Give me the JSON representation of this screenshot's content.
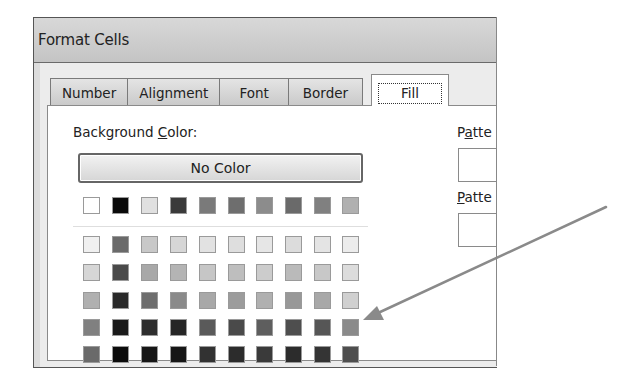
{
  "window": {
    "title": "Format Cells"
  },
  "tabs": [
    {
      "label": "Number",
      "active": false
    },
    {
      "label": "Alignment",
      "active": false
    },
    {
      "label": "Font",
      "active": false
    },
    {
      "label": "Border",
      "active": false
    },
    {
      "label": "Fill",
      "active": true
    }
  ],
  "fill": {
    "background_color_label_pre": "Background ",
    "background_color_label_accel": "C",
    "background_color_label_post": "olor:",
    "no_color_button": "No Color",
    "pattern_color_label_pre": "P",
    "pattern_color_label_accel": "a",
    "pattern_color_label_post": "tte",
    "pattern_style_label_accel": "P",
    "pattern_style_label_post": "atte",
    "theme_row": [
      "#ffffff",
      "#0a0a0a",
      "#e0e0e0",
      "#3a3a3a",
      "#7a7a7a",
      "#6e6e6e",
      "#8c8c8c",
      "#6a6a6a",
      "#808080",
      "#b0b0b0"
    ],
    "tint_rows": [
      [
        "#f0f0f0",
        "#6a6a6a",
        "#c8c8c8",
        "#d6d6d6",
        "#e2e2e2",
        "#dedede",
        "#e6e6e6",
        "#dcdcdc",
        "#e4e4e4",
        "#ececec"
      ],
      [
        "#d6d6d6",
        "#4a4a4a",
        "#a8a8a8",
        "#b4b4b4",
        "#c6c6c6",
        "#bebebe",
        "#cccccc",
        "#bababa",
        "#c8c8c8",
        "#dcdcdc"
      ],
      [
        "#b0b0b0",
        "#2a2a2a",
        "#6e6e6e",
        "#8a8a8a",
        "#a8a8a8",
        "#9c9c9c",
        "#b0b0b0",
        "#989898",
        "#a8a8a8",
        "#d0d0d0"
      ],
      [
        "#808080",
        "#1a1a1a",
        "#2e2e2e",
        "#262626",
        "#5a5a5a",
        "#4a4a4a",
        "#5e5e5e",
        "#4e4e4e",
        "#565656",
        "#8a8a8a"
      ],
      [
        "#6a6a6a",
        "#0c0c0c",
        "#161616",
        "#161616",
        "#323232",
        "#2c2c2c",
        "#3a3a3a",
        "#2c2c2c",
        "#343434",
        "#4e4e4e"
      ]
    ]
  },
  "annotation": {
    "arrow_color": "#8a8a8a"
  }
}
